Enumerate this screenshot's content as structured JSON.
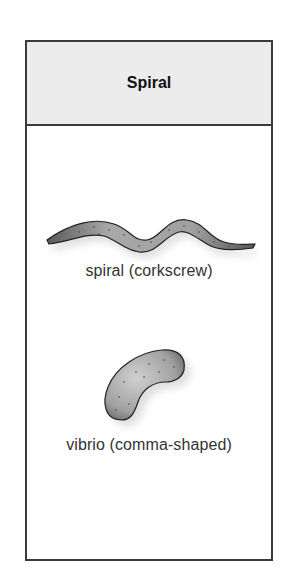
{
  "header": {
    "title": "Spiral"
  },
  "figures": [
    {
      "shape": "spiral-bacterium-icon",
      "caption": "spiral (corkscrew)"
    },
    {
      "shape": "vibrio-bacterium-icon",
      "caption": "vibrio (comma-shaped)"
    }
  ],
  "colors": {
    "border": "#3a3a3a",
    "header_bg": "#ececec",
    "cell_fill": "#9a9a9a",
    "text": "#333333"
  }
}
